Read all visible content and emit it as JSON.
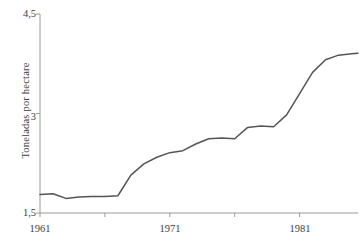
{
  "chart_data": {
    "type": "line",
    "title": "",
    "xlabel": "",
    "ylabel": "Toneladas por hectare",
    "xlim": [
      1961,
      1985.5
    ],
    "ylim": [
      1.5,
      4.5
    ],
    "grid": false,
    "legend": "none",
    "line_color": "#555555",
    "axis_color": "#9a9a9a",
    "background": "#ffffff",
    "ytick_labels": [
      "4,5",
      "3",
      "1,5"
    ],
    "ytick_values": [
      4.5,
      3,
      1.5
    ],
    "xtick_labels": [
      "1961",
      "",
      "1971",
      "",
      "1981"
    ],
    "xtick_values": [
      1961,
      1966,
      1971,
      1976,
      1981
    ],
    "x": [
      1961,
      1962,
      1963,
      1964,
      1965,
      1966,
      1967,
      1968,
      1969,
      1970,
      1971,
      1972,
      1973,
      1974,
      1975,
      1976,
      1977,
      1978,
      1979,
      1980,
      1981,
      1982,
      1983,
      1984,
      1985,
      1985.5
    ],
    "values": [
      1.78,
      1.79,
      1.72,
      1.74,
      1.75,
      1.75,
      1.76,
      2.07,
      2.24,
      2.34,
      2.41,
      2.44,
      2.54,
      2.62,
      2.63,
      2.62,
      2.79,
      2.81,
      2.8,
      2.98,
      3.3,
      3.62,
      3.81,
      3.88,
      3.9,
      3.91
    ],
    "series_name": "Toneladas por hectare"
  }
}
